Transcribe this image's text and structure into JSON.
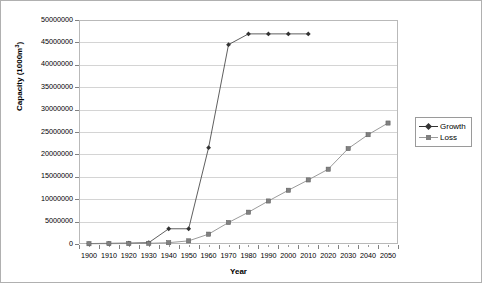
{
  "chart_data": {
    "type": "line",
    "title": "",
    "xlabel": "Year",
    "ylabel": "Capacity (1000m3)",
    "ylabel_base": "Capacity (1000m",
    "ylabel_sup": "3",
    "ylabel_tail": ")",
    "categories": [
      "1900",
      "1910",
      "1920",
      "1930",
      "1940",
      "1950",
      "1960",
      "1970",
      "1980",
      "1990",
      "2000",
      "2010",
      "2020",
      "2030",
      "2040",
      "2050"
    ],
    "ylim": [
      0,
      50000000
    ],
    "ytick_labels": [
      "50000000",
      "45000000",
      "40000000",
      "35000000",
      "30000000",
      "25000000",
      "20000000",
      "15000000",
      "10000000",
      "5000000",
      "0"
    ],
    "ytick_values": [
      50000000,
      45000000,
      40000000,
      35000000,
      30000000,
      25000000,
      20000000,
      15000000,
      10000000,
      5000000,
      0
    ],
    "grid": true,
    "legend_position": "right",
    "series": [
      {
        "name": "Growth",
        "color": "#333333",
        "marker": "diamond",
        "values": [
          100000,
          150000,
          200000,
          300000,
          3400000,
          3400000,
          21500000,
          44500000,
          46900000,
          46900000,
          46900000,
          46900000,
          null,
          null,
          null,
          null
        ]
      },
      {
        "name": "Loss",
        "color": "#808080",
        "marker": "square",
        "values": [
          60000,
          80000,
          100000,
          150000,
          300000,
          700000,
          2200000,
          4800000,
          7100000,
          9600000,
          12000000,
          14300000,
          16700000,
          21300000,
          24400000,
          27000000
        ]
      }
    ]
  },
  "legend": {
    "entries": [
      {
        "label": "Growth"
      },
      {
        "label": "Loss"
      }
    ]
  },
  "axis": {
    "x_title": "Year",
    "y_title_base": "Capacity (1000m",
    "y_title_sup": "3",
    "y_title_tail": ")"
  },
  "colors": {
    "growth": "#333333",
    "loss": "#808080",
    "gridline": "#d4d4d4",
    "plot_border": "#b9b9b9",
    "frame_border": "#b0b0b0"
  }
}
